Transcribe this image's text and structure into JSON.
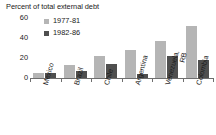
{
  "chart_data": {
    "type": "bar",
    "title": "Percent of total external debt",
    "xlabel": "",
    "ylabel": "",
    "ylim": [
      0,
      60
    ],
    "yticks": [
      0,
      20,
      40,
      60
    ],
    "grid": false,
    "legend_position": "top-left",
    "categories": [
      "Mexico",
      "Brazil",
      "Chile",
      "Argentina",
      "Venezuela, RB",
      "Colombia"
    ],
    "category_lines": [
      [
        "Mexico"
      ],
      [
        "Brazil"
      ],
      [
        "Chile"
      ],
      [
        "Argentina"
      ],
      [
        "Venezuela,",
        "RB"
      ],
      [
        "Colombia"
      ]
    ],
    "series": [
      {
        "name": "1977-81",
        "color": "#b5b5b5",
        "values": [
          5,
          13,
          22,
          28,
          37,
          52
        ]
      },
      {
        "name": "1982-86",
        "color": "#4f4f4f",
        "values": [
          5,
          7,
          14,
          4,
          22,
          18
        ]
      }
    ]
  },
  "colors": {
    "series_1977_81": "#b5b5b5",
    "series_1982_86": "#4f4f4f",
    "axis": "#6e6e6e",
    "text": "#1a1a1a",
    "background": "#ffffff"
  }
}
